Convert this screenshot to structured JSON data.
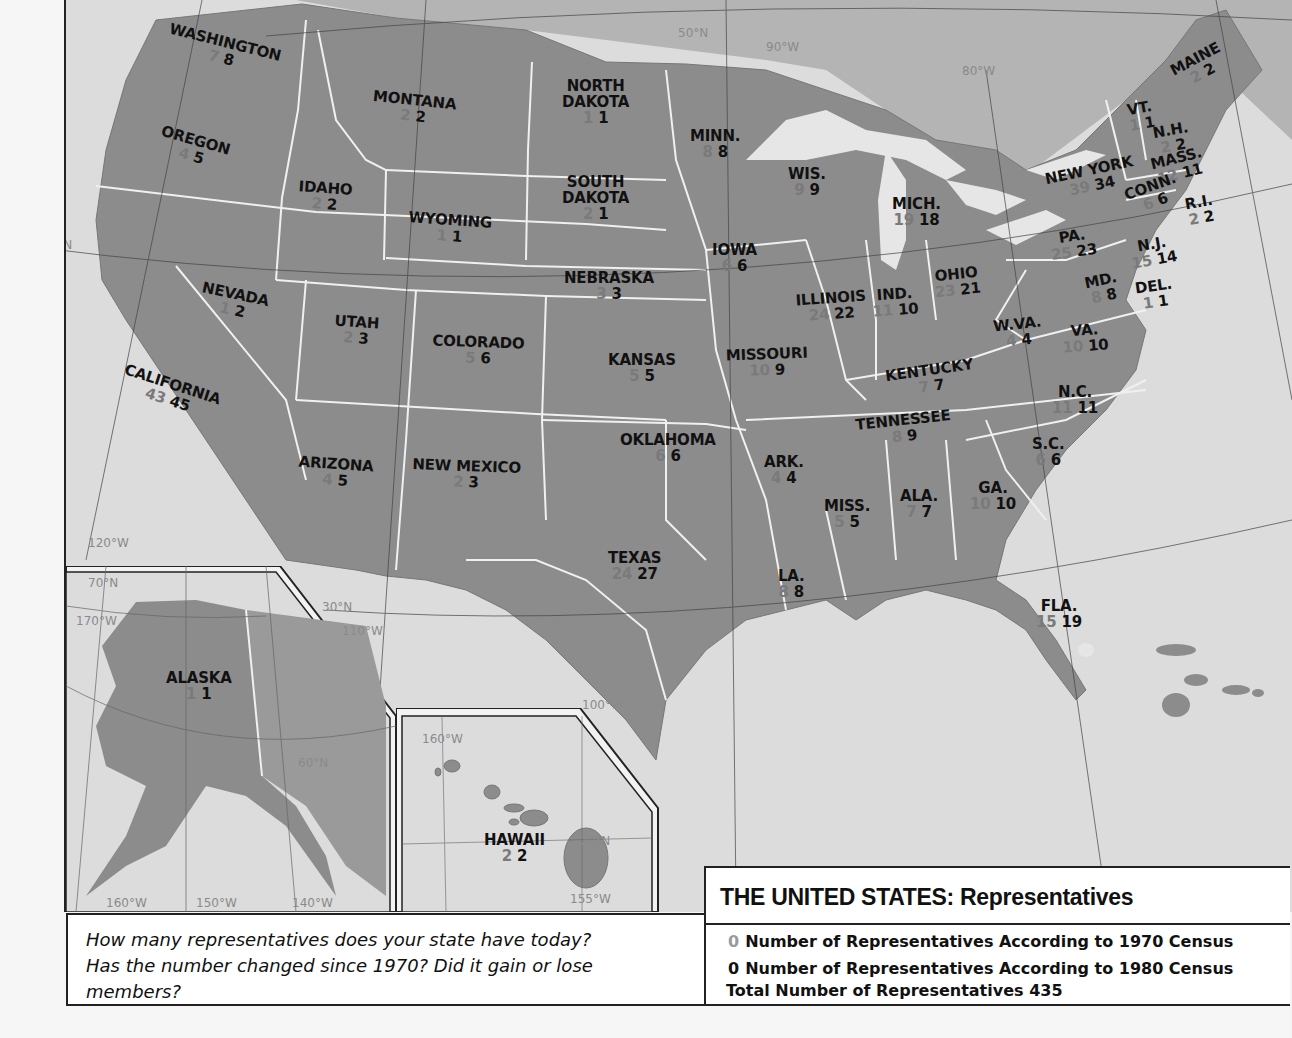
{
  "title": "THE UNITED STATES: Representatives",
  "legend": {
    "row_1970": {
      "sample": "0",
      "label": "Number of Representatives According to 1970 Census"
    },
    "row_1980": {
      "sample": "0",
      "label": "Number of Representatives According to 1980 Census"
    },
    "total": {
      "label": "Total Number of Representatives",
      "value": "435"
    },
    "colors": {
      "census_1970": "#8a8a8a",
      "census_1980": "#111111"
    }
  },
  "question": {
    "lines": [
      "How many representatives does your state have today?",
      "Has the number changed since 1970? Did it gain or lose",
      "members?"
    ]
  },
  "colors": {
    "land": "#8c8c8c",
    "water": "#dedede",
    "border": "#f2f2f2",
    "gridline": "#444444",
    "frame": "#222222"
  },
  "grid_labels": [
    {
      "text": "50°N",
      "x": 612,
      "y": 26
    },
    {
      "text": "90°W",
      "x": 700,
      "y": 40
    },
    {
      "text": "80°W",
      "x": 896,
      "y": 64
    },
    {
      "text": "40°N",
      "x": -24,
      "y": 238
    },
    {
      "text": "120°W",
      "x": 22,
      "y": 536
    },
    {
      "text": "70°N",
      "x": 22,
      "y": 576
    },
    {
      "text": "170°W",
      "x": 10,
      "y": 614
    },
    {
      "text": "30°N",
      "x": 256,
      "y": 600
    },
    {
      "text": "110°W",
      "x": 276,
      "y": 624
    },
    {
      "text": "100°W",
      "x": 516,
      "y": 698
    },
    {
      "text": "60°N",
      "x": 232,
      "y": 756
    },
    {
      "text": "160°W",
      "x": 356,
      "y": 732
    },
    {
      "text": "20°N",
      "x": 514,
      "y": 834
    },
    {
      "text": "160°W",
      "x": 40,
      "y": 896
    },
    {
      "text": "150°W",
      "x": 130,
      "y": 896
    },
    {
      "text": "140°W",
      "x": 226,
      "y": 896
    },
    {
      "text": "155°W",
      "x": 504,
      "y": 892
    }
  ],
  "states": [
    {
      "name": "WASHINGTON",
      "r1970": "7",
      "r1980": "8",
      "x": 100,
      "y": 34,
      "rot": 14
    },
    {
      "name": "OREGON",
      "r1970": "4",
      "r1980": "5",
      "x": 92,
      "y": 132,
      "rot": 16
    },
    {
      "name": "MONTANA",
      "r1970": "2",
      "r1980": "2",
      "x": 306,
      "y": 92,
      "rot": 6
    },
    {
      "name": "IDAHO",
      "r1970": "2",
      "r1980": "2",
      "x": 232,
      "y": 180,
      "rot": 4
    },
    {
      "name": "WYOMING",
      "r1970": "1",
      "r1980": "1",
      "x": 342,
      "y": 212,
      "rot": 4
    },
    {
      "name": "NORTH\nDAKOTA",
      "r1970": "1",
      "r1980": "1",
      "x": 496,
      "y": 78,
      "rot": 0
    },
    {
      "name": "SOUTH\nDAKOTA",
      "r1970": "2",
      "r1980": "1",
      "x": 496,
      "y": 174,
      "rot": 0
    },
    {
      "name": "MINN.",
      "r1970": "8",
      "r1980": "8",
      "x": 624,
      "y": 128,
      "rot": 0
    },
    {
      "name": "WIS.",
      "r1970": "9",
      "r1980": "9",
      "x": 722,
      "y": 166,
      "rot": 0
    },
    {
      "name": "MICH.",
      "r1970": "19",
      "r1980": "18",
      "x": 826,
      "y": 196,
      "rot": 0
    },
    {
      "name": "NEW YORK",
      "r1970": "39",
      "r1980": "34",
      "x": 980,
      "y": 162,
      "rot": -12
    },
    {
      "name": "MAINE",
      "r1970": "2",
      "r1980": "2",
      "x": 1106,
      "y": 50,
      "rot": -28
    },
    {
      "name": "VT.",
      "r1970": "1",
      "r1980": "1",
      "x": 1062,
      "y": 100,
      "rot": -10
    },
    {
      "name": "N.H.",
      "r1970": "2",
      "r1980": "2",
      "x": 1088,
      "y": 122,
      "rot": -10
    },
    {
      "name": "MASS.",
      "r1970": "12",
      "r1980": "11",
      "x": 1086,
      "y": 150,
      "rot": -14
    },
    {
      "name": "CONN.",
      "r1970": "6",
      "r1980": "6",
      "x": 1060,
      "y": 178,
      "rot": -20
    },
    {
      "name": "R.I.",
      "r1970": "2",
      "r1980": "2",
      "x": 1120,
      "y": 194,
      "rot": -10
    },
    {
      "name": "PA.",
      "r1970": "25",
      "r1980": "23",
      "x": 984,
      "y": 228,
      "rot": -8
    },
    {
      "name": "N.J.",
      "r1970": "15",
      "r1980": "14",
      "x": 1064,
      "y": 236,
      "rot": -10
    },
    {
      "name": "MD.",
      "r1970": "8",
      "r1980": "8",
      "x": 1020,
      "y": 272,
      "rot": -12
    },
    {
      "name": "DEL.",
      "r1970": "1",
      "r1980": "1",
      "x": 1070,
      "y": 278,
      "rot": -8
    },
    {
      "name": "IOWA",
      "r1970": "6",
      "r1980": "6",
      "x": 646,
      "y": 242,
      "rot": 0
    },
    {
      "name": "NEBRASKA",
      "r1970": "3",
      "r1980": "3",
      "x": 498,
      "y": 270,
      "rot": 0
    },
    {
      "name": "NEVADA",
      "r1970": "1",
      "r1980": "2",
      "x": 134,
      "y": 286,
      "rot": 12
    },
    {
      "name": "UTAH",
      "r1970": "2",
      "r1980": "3",
      "x": 268,
      "y": 314,
      "rot": 4
    },
    {
      "name": "COLORADO",
      "r1970": "5",
      "r1980": "6",
      "x": 366,
      "y": 334,
      "rot": 2
    },
    {
      "name": "KANSAS",
      "r1970": "5",
      "r1980": "5",
      "x": 542,
      "y": 352,
      "rot": 0
    },
    {
      "name": "MISSOURI",
      "r1970": "10",
      "r1980": "9",
      "x": 660,
      "y": 346,
      "rot": -2
    },
    {
      "name": "ILLINOIS",
      "r1970": "24",
      "r1980": "22",
      "x": 730,
      "y": 290,
      "rot": -4
    },
    {
      "name": "IND.",
      "r1970": "11",
      "r1980": "10",
      "x": 806,
      "y": 286,
      "rot": -4
    },
    {
      "name": "OHIO",
      "r1970": "23",
      "r1980": "21",
      "x": 868,
      "y": 266,
      "rot": -6
    },
    {
      "name": "W.VA.",
      "r1970": "4",
      "r1980": "4",
      "x": 928,
      "y": 316,
      "rot": -6
    },
    {
      "name": "VA.",
      "r1970": "10",
      "r1980": "10",
      "x": 996,
      "y": 322,
      "rot": -4
    },
    {
      "name": "KENTUCKY",
      "r1970": "7",
      "r1980": "7",
      "x": 820,
      "y": 362,
      "rot": -8
    },
    {
      "name": "TENNESSEE",
      "r1970": "8",
      "r1980": "9",
      "x": 790,
      "y": 412,
      "rot": -6
    },
    {
      "name": "N.C.",
      "r1970": "11",
      "r1980": "11",
      "x": 986,
      "y": 384,
      "rot": 0
    },
    {
      "name": "S.C.",
      "r1970": "6",
      "r1980": "6",
      "x": 966,
      "y": 436,
      "rot": 0
    },
    {
      "name": "CALIFORNIA",
      "r1970": "43",
      "r1980": "45",
      "x": 54,
      "y": 376,
      "rot": 18
    },
    {
      "name": "ARIZONA",
      "r1970": "4",
      "r1980": "5",
      "x": 232,
      "y": 456,
      "rot": 4
    },
    {
      "name": "NEW MEXICO",
      "r1970": "2",
      "r1980": "3",
      "x": 346,
      "y": 458,
      "rot": 2
    },
    {
      "name": "OKLAHOMA",
      "r1970": "6",
      "r1980": "6",
      "x": 554,
      "y": 432,
      "rot": 0
    },
    {
      "name": "ARK.",
      "r1970": "4",
      "r1980": "4",
      "x": 698,
      "y": 454,
      "rot": 0
    },
    {
      "name": "MISS.",
      "r1970": "5",
      "r1980": "5",
      "x": 758,
      "y": 498,
      "rot": 0
    },
    {
      "name": "ALA.",
      "r1970": "7",
      "r1980": "7",
      "x": 834,
      "y": 488,
      "rot": 0
    },
    {
      "name": "GA.",
      "r1970": "10",
      "r1980": "10",
      "x": 904,
      "y": 480,
      "rot": 0
    },
    {
      "name": "TEXAS",
      "r1970": "24",
      "r1980": "27",
      "x": 542,
      "y": 550,
      "rot": 0
    },
    {
      "name": "LA.",
      "r1970": "8",
      "r1980": "8",
      "x": 712,
      "y": 568,
      "rot": 0
    },
    {
      "name": "FLA.",
      "r1970": "15",
      "r1980": "19",
      "x": 970,
      "y": 598,
      "rot": 0
    },
    {
      "name": "ALASKA",
      "r1970": "1",
      "r1980": "1",
      "x": 100,
      "y": 670,
      "rot": 0
    },
    {
      "name": "HAWAII",
      "r1970": "2",
      "r1980": "2",
      "x": 418,
      "y": 832,
      "rot": 0
    }
  ]
}
